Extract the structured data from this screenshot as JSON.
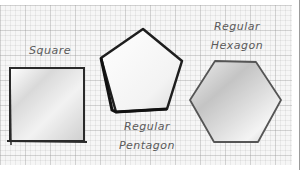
{
  "diagram": {
    "background": "graph-paper",
    "shapes": [
      {
        "name": "square",
        "label_lines": [
          "Square"
        ]
      },
      {
        "name": "regular-pentagon",
        "label_lines": [
          "Regular",
          "Pentagon"
        ]
      },
      {
        "name": "regular-hexagon",
        "label_lines": [
          "Regular",
          "Hexagon"
        ]
      }
    ],
    "colors": {
      "outline": "#2a2a2a",
      "fill_light": "#fafafa",
      "fill_shade": "#c8c8c8",
      "label": "#5a5a5a"
    }
  }
}
